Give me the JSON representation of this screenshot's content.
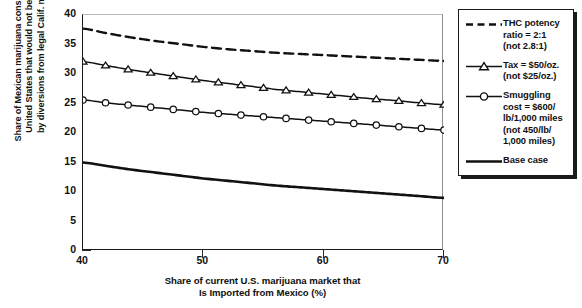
{
  "chart_data": {
    "type": "line",
    "title": "",
    "xlabel": "Share of current U.S. marijuana market that Is Imported from Mexico (%)",
    "xlabel_lines": [
      "Share of current U.S. marijuana market that",
      "Is Imported from Mexico (%)"
    ],
    "ylabel": "Share of Mexican marijuana consumed in the United States that would not be undercut by diversions from legal Calif. market (%)",
    "ylabel_lines": [
      "Share of Mexican marijuana consumed in the",
      "United States that would not be undercut",
      "by diversions from legal Calif. market (%)"
    ],
    "xlim": [
      40,
      70
    ],
    "ylim": [
      0,
      40
    ],
    "xticks": [
      40,
      50,
      60,
      70
    ],
    "xtick_labels": [
      "40",
      "50",
      "60",
      "70"
    ],
    "yticks": [
      0,
      5,
      10,
      15,
      20,
      25,
      30,
      35,
      40
    ],
    "ytick_labels": [
      "0",
      "5",
      "10",
      "15",
      "20",
      "25",
      "30",
      "35",
      "40"
    ],
    "grid": false,
    "legend_position": "right-outside",
    "x": [
      40,
      42,
      44,
      46,
      48,
      50,
      52,
      54,
      56,
      58,
      60,
      62,
      64,
      66,
      68,
      70
    ],
    "series": [
      {
        "name": "THC potency ratio = 2:1 (not 2.8:1)",
        "legend_lines": [
          "THC potency",
          "ratio = 2:1",
          "(not 2.8:1)"
        ],
        "style": "dashed",
        "marker": "none",
        "color": "#111111",
        "values": [
          37.7,
          36.9,
          36.2,
          35.6,
          35.1,
          34.6,
          34.2,
          33.9,
          33.6,
          33.4,
          33.2,
          33.0,
          32.8,
          32.6,
          32.4,
          32.2
        ]
      },
      {
        "name": "Tax = $50/oz. (not $25/oz.)",
        "legend_lines": [
          "Tax = $50/oz.",
          "(not $25/oz.)"
        ],
        "style": "solid",
        "marker": "triangle",
        "color": "#111111",
        "values": [
          32.1,
          31.4,
          30.7,
          30.1,
          29.5,
          28.9,
          28.4,
          27.9,
          27.4,
          27.0,
          26.6,
          26.2,
          25.8,
          25.5,
          25.1,
          24.8
        ]
      },
      {
        "name": "Smuggling cost = $600/lb/1,000 miles (not 450/lb/1,000 miles)",
        "legend_lines": [
          "Smuggling",
          "cost = $600/",
          "lb/1,000 miles",
          "(not 450/lb/",
          "1,000 miles)"
        ],
        "style": "solid",
        "marker": "circle",
        "color": "#111111",
        "values": [
          25.6,
          25.1,
          24.7,
          24.3,
          23.9,
          23.5,
          23.2,
          22.9,
          22.6,
          22.3,
          22.0,
          21.7,
          21.4,
          21.1,
          20.8,
          20.5
        ]
      },
      {
        "name": "Base case",
        "legend_lines": [
          "Base case"
        ],
        "style": "solid-thick",
        "marker": "none",
        "color": "#111111",
        "values": [
          15.0,
          14.4,
          13.8,
          13.3,
          12.8,
          12.3,
          11.9,
          11.5,
          11.1,
          10.8,
          10.5,
          10.2,
          9.9,
          9.6,
          9.3,
          9.0
        ]
      }
    ]
  }
}
